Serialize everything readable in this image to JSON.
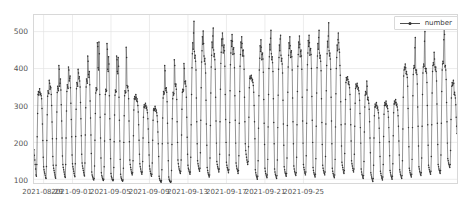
{
  "chart_data": {
    "type": "line",
    "title": "",
    "xlabel": "",
    "ylabel": "",
    "legend": [
      {
        "name": "number",
        "color": "#3b3b3b",
        "marker": "dot"
      }
    ],
    "legend_position": "upper right",
    "grid": true,
    "ylim": [
      90,
      545
    ],
    "yticks": [
      100,
      200,
      300,
      400,
      500
    ],
    "ytick_labels": [
      "100",
      "200",
      "300",
      "400",
      "500"
    ],
    "xlim": [
      "2021-08-28 00:00",
      "2021-09-25 23:00"
    ],
    "xticks": [
      "2021-08-29",
      "2021-09-01",
      "2021-09-05",
      "2021-09-09",
      "2021-09-13",
      "2021-09-17",
      "2021-09-21",
      "2021-09-25"
    ],
    "x_start_date": "2021-08-28",
    "sampling": "hourly",
    "series": [
      {
        "name": "number",
        "color": "#3b3b3b",
        "values": [
          180,
          165,
          152,
          140,
          128,
          112,
          108,
          140,
          215,
          278,
          330,
          338,
          328,
          335,
          345,
          336,
          330,
          332,
          326,
          318,
          292,
          250,
          205,
          160,
          134,
          126,
          120,
          115,
          110,
          104,
          102,
          135,
          205,
          275,
          325,
          340,
          334,
          332,
          368,
          360,
          344,
          352,
          348,
          330,
          300,
          255,
          210,
          162,
          138,
          130,
          124,
          118,
          112,
          106,
          103,
          138,
          210,
          282,
          335,
          352,
          345,
          340,
          408,
          398,
          352,
          360,
          372,
          342,
          302,
          258,
          212,
          163,
          140,
          132,
          126,
          120,
          114,
          108,
          105,
          140,
          212,
          285,
          338,
          356,
          350,
          346,
          404,
          396,
          366,
          374,
          380,
          348,
          306,
          262,
          215,
          166,
          142,
          134,
          128,
          122,
          116,
          110,
          107,
          142,
          216,
          290,
          345,
          362,
          358,
          352,
          398,
          388,
          372,
          378,
          366,
          350,
          308,
          264,
          218,
          168,
          144,
          136,
          130,
          124,
          118,
          112,
          109,
          144,
          220,
          294,
          350,
          372,
          366,
          360,
          434,
          420,
          384,
          376,
          392,
          356,
          312,
          266,
          220,
          170,
          120,
          112,
          108,
          104,
          100,
          98,
          102,
          136,
          206,
          278,
          334,
          348,
          340,
          344,
          470,
          460,
          402,
          396,
          472,
          440,
          330,
          268,
          212,
          158,
          118,
          110,
          106,
          102,
          99,
          97,
          100,
          134,
          204,
          276,
          330,
          344,
          338,
          340,
          468,
          452,
          398,
          392,
          432,
          412,
          326,
          264,
          208,
          156,
          116,
          108,
          104,
          100,
          98,
          96,
          99,
          132,
          202,
          274,
          328,
          342,
          336,
          338,
          434,
          424,
          392,
          386,
          430,
          406,
          322,
          260,
          204,
          154,
          114,
          106,
          102,
          99,
          97,
          95,
          98,
          130,
          200,
          272,
          326,
          340,
          334,
          336,
          458,
          430,
          354,
          348,
          352,
          340,
          318,
          258,
          202,
          152,
          140,
          132,
          126,
          120,
          116,
          112,
          118,
          150,
          218,
          288,
          318,
          324,
          316,
          320,
          330,
          322,
          312,
          318,
          310,
          300,
          282,
          248,
          206,
          168,
          142,
          134,
          128,
          122,
          118,
          114,
          120,
          148,
          212,
          268,
          296,
          302,
          294,
          298,
          306,
          300,
          292,
          296,
          288,
          280,
          264,
          236,
          200,
          166,
          136,
          128,
          122,
          116,
          112,
          108,
          114,
          144,
          206,
          260,
          288,
          292,
          286,
          290,
          298,
          292,
          284,
          288,
          280,
          272,
          256,
          228,
          196,
          162,
          108,
          102,
          98,
          96,
          94,
          92,
          96,
          126,
          196,
          266,
          320,
          338,
          330,
          334,
          408,
          394,
          346,
          340,
          348,
          336,
          310,
          252,
          198,
          150,
          106,
          100,
          97,
          95,
          93,
          91,
          95,
          124,
          194,
          264,
          318,
          336,
          328,
          332,
          424,
          408,
          358,
          352,
          358,
          344,
          316,
          256,
          200,
          152,
          142,
          134,
          128,
          124,
          120,
          116,
          122,
          152,
          220,
          290,
          336,
          344,
          338,
          342,
          414,
          400,
          364,
          358,
          366,
          352,
          322,
          268,
          214,
          168,
          138,
          130,
          126,
          122,
          118,
          114,
          120,
          160,
          248,
          330,
          402,
          440,
          470,
          452,
          496,
          528,
          446,
          428,
          436,
          420,
          396,
          320,
          256,
          196,
          150,
          142,
          136,
          130,
          126,
          122,
          130,
          172,
          260,
          348,
          418,
          448,
          486,
          466,
          502,
          468,
          434,
          420,
          428,
          412,
          388,
          314,
          250,
          192,
          132,
          124,
          118,
          114,
          110,
          106,
          112,
          158,
          246,
          334,
          404,
          436,
          472,
          456,
          488,
          510,
          450,
          432,
          440,
          424,
          398,
          322,
          258,
          198,
          148,
          140,
          134,
          130,
          126,
          120,
          128,
          168,
          256,
          344,
          414,
          444,
          480,
          462,
          496,
          480,
          442,
          458,
          464,
          448,
          406,
          330,
          262,
          200,
          146,
          138,
          132,
          128,
          124,
          118,
          126,
          166,
          254,
          340,
          410,
          442,
          476,
          460,
          492,
          474,
          438,
          452,
          456,
          440,
          402,
          326,
          260,
          198,
          144,
          136,
          130,
          126,
          122,
          116,
          124,
          164,
          252,
          338,
          406,
          438,
          472,
          456,
          486,
          468,
          434,
          448,
          450,
          434,
          398,
          322,
          256,
          196,
          178,
          168,
          160,
          152,
          146,
          140,
          148,
          188,
          268,
          348,
          374,
          380,
          372,
          376,
          382,
          374,
          366,
          370,
          362,
          354,
          336,
          300,
          256,
          210,
          126,
          118,
          112,
          108,
          104,
          100,
          108,
          150,
          238,
          326,
          396,
          428,
          462,
          446,
          478,
          458,
          424,
          438,
          442,
          426,
          390,
          316,
          252,
          194,
          130,
          122,
          116,
          112,
          108,
          104,
          112,
          154,
          242,
          330,
          400,
          432,
          466,
          450,
          482,
          504,
          440,
          424,
          432,
          416,
          392,
          318,
          254,
          196,
          128,
          120,
          114,
          110,
          106,
          102,
          110,
          152,
          240,
          328,
          398,
          430,
          464,
          448,
          480,
          490,
          436,
          420,
          428,
          412,
          388,
          314,
          250,
          192,
          134,
          126,
          120,
          116,
          112,
          108,
          116,
          158,
          246,
          336,
          404,
          436,
          470,
          454,
          486,
          462,
          430,
          444,
          448,
          432,
          396,
          320,
          256,
          196,
          136,
          128,
          122,
          118,
          114,
          110,
          118,
          160,
          248,
          338,
          406,
          438,
          472,
          456,
          488,
          466,
          432,
          446,
          450,
          434,
          398,
          322,
          258,
          198,
          140,
          132,
          126,
          120,
          116,
          112,
          120,
          164,
          252,
          342,
          410,
          442,
          476,
          460,
          490,
          470,
          436,
          450,
          454,
          438,
          400,
          324,
          260,
          200,
          132,
          124,
          118,
          114,
          110,
          106,
          114,
          156,
          244,
          334,
          402,
          434,
          468,
          452,
          484,
          504,
          442,
          428,
          436,
          420,
          394,
          318,
          254,
          194,
          138,
          130,
          124,
          120,
          116,
          112,
          120,
          162,
          250,
          340,
          408,
          440,
          474,
          458,
          488,
          524,
          448,
          434,
          442,
          426,
          398,
          322,
          258,
          196,
          130,
          122,
          116,
          112,
          108,
          104,
          112,
          154,
          242,
          332,
          400,
          430,
          464,
          448,
          478,
          496,
          470,
          452,
          444,
          408,
          382,
          310,
          248,
          190,
          146,
          138,
          132,
          126,
          120,
          116,
          124,
          170,
          250,
          316,
          362,
          376,
          368,
          372,
          378,
          370,
          358,
          364,
          356,
          348,
          330,
          290,
          248,
          204,
          150,
          142,
          136,
          130,
          124,
          120,
          128,
          168,
          244,
          306,
          346,
          358,
          350,
          354,
          360,
          352,
          344,
          348,
          340,
          332,
          314,
          278,
          240,
          198,
          128,
          120,
          114,
          110,
          106,
          102,
          110,
          148,
          228,
          296,
          328,
          338,
          330,
          334,
          366,
          352,
          316,
          322,
          314,
          306,
          290,
          256,
          212,
          172,
          118,
          112,
          106,
          102,
          98,
          94,
          102,
          138,
          212,
          272,
          296,
          304,
          296,
          300,
          308,
          300,
          292,
          296,
          288,
          280,
          266,
          238,
          200,
          162,
          122,
          116,
          110,
          106,
          102,
          98,
          106,
          140,
          216,
          276,
          300,
          308,
          300,
          304,
          312,
          304,
          296,
          300,
          292,
          284,
          268,
          240,
          202,
          164,
          124,
          118,
          112,
          108,
          104,
          100,
          108,
          142,
          218,
          280,
          304,
          312,
          304,
          308,
          316,
          308,
          300,
          304,
          296,
          288,
          272,
          244,
          204,
          166,
          126,
          120,
          114,
          110,
          106,
          102,
          110,
          150,
          236,
          322,
          380,
          396,
          404,
          398,
          412,
          402,
          386,
          392,
          384,
          376,
          352,
          292,
          240,
          188,
          130,
          124,
          118,
          114,
          110,
          106,
          114,
          154,
          240,
          326,
          384,
          400,
          408,
          402,
          456,
          484,
          396,
          388,
          396,
          384,
          358,
          296,
          244,
          190,
          134,
          128,
          122,
          118,
          114,
          110,
          118,
          158,
          244,
          330,
          388,
          404,
          412,
          406,
          474,
          500,
          400,
          392,
          400,
          388,
          362,
          300,
          248,
          192,
          138,
          132,
          126,
          122,
          118,
          114,
          122,
          162,
          248,
          334,
          392,
          408,
          416,
          410,
          444,
          426,
          404,
          396,
          404,
          392,
          366,
          304,
          252,
          194,
          140,
          134,
          128,
          124,
          120,
          116,
          124,
          166,
          252,
          338,
          396,
          412,
          420,
          414,
          478,
          510,
          492,
          404,
          408,
          396,
          370,
          308,
          256,
          198,
          156,
          150,
          144,
          140,
          136,
          132,
          140,
          178,
          262,
          320,
          352,
          362,
          354,
          358,
          368,
          360,
          330,
          336,
          328,
          320,
          302,
          268,
          244,
          224
        ]
      }
    ]
  },
  "legend_box": {
    "label": "number"
  },
  "axis": {
    "y_labels": [
      "500",
      "400",
      "300",
      "200",
      "100"
    ],
    "x_labels": [
      "2021-08-29",
      "2021-09-01",
      "2021-09-05",
      "2021-09-09",
      "2021-09-13",
      "2021-09-17",
      "2021-09-21",
      "2021-09-25"
    ]
  }
}
